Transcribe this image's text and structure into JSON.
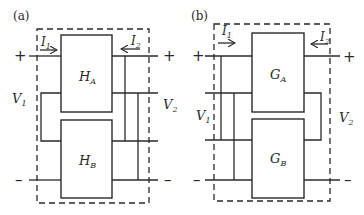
{
  "panels": [
    {
      "tag": "(a)",
      "block_top": {
        "sym": "H",
        "sub": "A"
      },
      "block_bottom": {
        "sym": "H",
        "sub": "B"
      },
      "current_in": {
        "sym": "I",
        "sub": "1"
      },
      "current_out": {
        "sym": "I",
        "sub": "2"
      },
      "voltage_left": {
        "sym": "V",
        "sub": "1"
      },
      "voltage_right": {
        "sym": "V",
        "sub": "2"
      },
      "plus": "+",
      "minus": "–",
      "connection": "series-input, parallel-output"
    },
    {
      "tag": "(b)",
      "block_top": {
        "sym": "G",
        "sub": "A"
      },
      "block_bottom": {
        "sym": "G",
        "sub": "B"
      },
      "current_in": {
        "sym": "I",
        "sub": "1"
      },
      "current_out": {
        "sym": "I",
        "sub": "2"
      },
      "voltage_left": {
        "sym": "V",
        "sub": "1"
      },
      "voltage_right": {
        "sym": "V",
        "sub": "2"
      },
      "plus": "+",
      "minus": "–",
      "connection": "parallel-input, series-output"
    }
  ]
}
